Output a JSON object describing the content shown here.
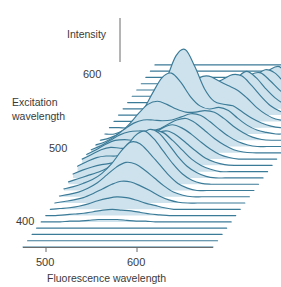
{
  "figure": {
    "type": "waterfall-3d-spectrum",
    "title": "",
    "axes": {
      "vertical": {
        "label": "Intensity",
        "name": "intensity-axis"
      },
      "depth": {
        "label_line1": "Excitation",
        "label_line2": "wavelength",
        "ticks": [
          "600",
          "500",
          "400"
        ],
        "units": "nm"
      },
      "horizontal": {
        "label": "Fluorescence wavelength",
        "ticks": [
          "500",
          "600"
        ],
        "units": "nm"
      }
    },
    "colors": {
      "trace_fill": "#cde2ec",
      "trace_stroke": "#3c7b98",
      "axis": "#6b6b6b",
      "text": "#3a3a3a",
      "background": "#ffffff"
    }
  },
  "chart_data": {
    "type": "line",
    "title": "",
    "subtitle": "",
    "xlabel": "Fluorescence wavelength",
    "ylabel": "Intensity",
    "zlabel": "Excitation wavelength",
    "xlim": [
      460,
      680
    ],
    "zlim": [
      380,
      620
    ],
    "xticks": [
      500,
      600
    ],
    "zticks": [
      400,
      500,
      600
    ],
    "grid": false,
    "legend": null,
    "n_traces": 30,
    "x": [
      0,
      0.05,
      0.1,
      0.15,
      0.2,
      0.25,
      0.3,
      0.35,
      0.4,
      0.45,
      0.5,
      0.55,
      0.6,
      0.65,
      0.7,
      0.75,
      0.8,
      0.85,
      0.9,
      0.95,
      1.0
    ],
    "series": [
      {
        "name": "ex_620",
        "z": 620,
        "values": [
          0,
          0,
          0,
          0,
          0,
          0,
          0,
          0,
          0,
          0,
          0,
          0,
          0,
          0,
          0,
          0,
          0,
          0,
          0,
          0,
          0
        ]
      },
      {
        "name": "ex_612",
        "z": 612,
        "values": [
          0,
          0,
          0,
          0,
          0,
          0,
          0,
          0,
          0,
          0,
          0,
          0,
          0,
          0,
          0,
          0,
          0,
          0,
          0,
          0,
          0
        ]
      },
      {
        "name": "ex_604",
        "z": 604,
        "values": [
          0,
          0,
          0,
          0,
          0,
          0,
          0,
          0,
          0,
          0,
          0,
          0,
          0,
          0,
          0.05,
          0.1,
          0.07,
          0.03,
          0.01,
          0,
          0
        ]
      },
      {
        "name": "ex_596",
        "z": 596,
        "values": [
          0,
          0,
          0,
          0,
          0,
          0,
          0,
          0,
          0,
          0,
          0,
          0,
          0.02,
          0.06,
          0.14,
          0.22,
          0.14,
          0.06,
          0.02,
          0,
          0
        ]
      },
      {
        "name": "ex_588",
        "z": 588,
        "values": [
          0,
          0,
          0,
          0,
          0,
          0,
          0,
          0,
          0,
          0,
          0,
          0.03,
          0.08,
          0.16,
          0.26,
          0.3,
          0.18,
          0.08,
          0.03,
          0,
          0
        ]
      },
      {
        "name": "ex_580",
        "z": 580,
        "values": [
          0,
          0,
          0,
          0,
          0,
          0,
          0,
          0,
          0,
          0.02,
          0.05,
          0.09,
          0.16,
          0.26,
          0.34,
          0.3,
          0.18,
          0.08,
          0.03,
          0,
          0
        ]
      },
      {
        "name": "ex_572",
        "z": 572,
        "values": [
          0,
          0,
          0,
          0,
          0,
          0,
          0,
          0,
          0.03,
          0.07,
          0.12,
          0.18,
          0.26,
          0.36,
          0.38,
          0.28,
          0.16,
          0.07,
          0.02,
          0,
          0
        ]
      },
      {
        "name": "ex_564",
        "z": 564,
        "values": [
          0,
          0,
          0,
          0,
          0,
          0,
          0.02,
          0.05,
          0.1,
          0.16,
          0.22,
          0.3,
          0.4,
          0.48,
          0.4,
          0.26,
          0.14,
          0.06,
          0.02,
          0,
          0
        ]
      },
      {
        "name": "ex_556",
        "z": 556,
        "values": [
          0,
          0,
          0,
          0,
          0,
          0.03,
          0.07,
          0.13,
          0.22,
          0.32,
          0.4,
          0.46,
          0.52,
          0.5,
          0.38,
          0.24,
          0.12,
          0.05,
          0.01,
          0,
          0
        ]
      },
      {
        "name": "ex_548",
        "z": 548,
        "values": [
          0,
          0,
          0,
          0,
          0.04,
          0.1,
          0.18,
          0.3,
          0.44,
          0.56,
          0.58,
          0.52,
          0.46,
          0.4,
          0.3,
          0.18,
          0.09,
          0.03,
          0.01,
          0,
          0
        ]
      },
      {
        "name": "ex_540",
        "z": 540,
        "values": [
          0,
          0,
          0,
          0.06,
          0.16,
          0.34,
          0.62,
          0.92,
          1.0,
          0.78,
          0.5,
          0.34,
          0.3,
          0.28,
          0.2,
          0.12,
          0.06,
          0.02,
          0,
          0,
          0
        ]
      },
      {
        "name": "ex_532",
        "z": 532,
        "values": [
          0,
          0,
          0.05,
          0.14,
          0.3,
          0.52,
          0.72,
          0.78,
          0.66,
          0.48,
          0.36,
          0.32,
          0.34,
          0.3,
          0.2,
          0.11,
          0.05,
          0.02,
          0,
          0,
          0
        ]
      },
      {
        "name": "ex_524",
        "z": 524,
        "values": [
          0,
          0.03,
          0.09,
          0.2,
          0.34,
          0.46,
          0.5,
          0.46,
          0.4,
          0.36,
          0.36,
          0.38,
          0.36,
          0.28,
          0.18,
          0.1,
          0.04,
          0.01,
          0,
          0,
          0
        ]
      },
      {
        "name": "ex_516",
        "z": 516,
        "values": [
          0.02,
          0.06,
          0.13,
          0.22,
          0.3,
          0.34,
          0.34,
          0.33,
          0.34,
          0.38,
          0.42,
          0.4,
          0.32,
          0.22,
          0.13,
          0.06,
          0.02,
          0,
          0,
          0,
          0
        ]
      },
      {
        "name": "ex_508",
        "z": 508,
        "values": [
          0.04,
          0.09,
          0.16,
          0.23,
          0.27,
          0.28,
          0.28,
          0.3,
          0.36,
          0.42,
          0.44,
          0.38,
          0.28,
          0.18,
          0.1,
          0.04,
          0.01,
          0,
          0,
          0,
          0
        ]
      },
      {
        "name": "ex_500",
        "z": 500,
        "values": [
          0.06,
          0.12,
          0.19,
          0.24,
          0.25,
          0.24,
          0.26,
          0.32,
          0.4,
          0.44,
          0.4,
          0.32,
          0.22,
          0.13,
          0.06,
          0.02,
          0,
          0,
          0,
          0,
          0
        ]
      },
      {
        "name": "ex_492",
        "z": 492,
        "values": [
          0.08,
          0.14,
          0.2,
          0.23,
          0.22,
          0.22,
          0.26,
          0.34,
          0.42,
          0.44,
          0.38,
          0.28,
          0.18,
          0.09,
          0.04,
          0.01,
          0,
          0,
          0,
          0,
          0
        ]
      },
      {
        "name": "ex_484",
        "z": 484,
        "values": [
          0.07,
          0.13,
          0.18,
          0.2,
          0.2,
          0.22,
          0.3,
          0.42,
          0.52,
          0.5,
          0.4,
          0.28,
          0.16,
          0.08,
          0.03,
          0,
          0,
          0,
          0,
          0,
          0
        ]
      },
      {
        "name": "ex_476",
        "z": 476,
        "values": [
          0.05,
          0.1,
          0.14,
          0.17,
          0.19,
          0.24,
          0.36,
          0.52,
          0.62,
          0.58,
          0.44,
          0.28,
          0.15,
          0.07,
          0.02,
          0,
          0,
          0,
          0,
          0,
          0
        ]
      },
      {
        "name": "ex_468",
        "z": 468,
        "values": [
          0.03,
          0.07,
          0.11,
          0.15,
          0.2,
          0.3,
          0.46,
          0.62,
          0.68,
          0.58,
          0.42,
          0.26,
          0.13,
          0.05,
          0.01,
          0,
          0,
          0,
          0,
          0,
          0
        ]
      },
      {
        "name": "ex_460",
        "z": 460,
        "values": [
          0.02,
          0.05,
          0.09,
          0.14,
          0.22,
          0.34,
          0.5,
          0.62,
          0.6,
          0.48,
          0.34,
          0.2,
          0.09,
          0.03,
          0,
          0,
          0,
          0,
          0,
          0,
          0
        ]
      },
      {
        "name": "ex_452",
        "z": 452,
        "values": [
          0.01,
          0.03,
          0.06,
          0.11,
          0.18,
          0.28,
          0.38,
          0.44,
          0.42,
          0.34,
          0.24,
          0.14,
          0.06,
          0.02,
          0,
          0,
          0,
          0,
          0,
          0,
          0
        ]
      },
      {
        "name": "ex_444",
        "z": 444,
        "values": [
          0,
          0.02,
          0.04,
          0.07,
          0.12,
          0.18,
          0.24,
          0.28,
          0.27,
          0.22,
          0.16,
          0.09,
          0.04,
          0.01,
          0,
          0,
          0,
          0,
          0,
          0,
          0
        ]
      },
      {
        "name": "ex_436",
        "z": 436,
        "values": [
          0,
          0.01,
          0.02,
          0.04,
          0.07,
          0.11,
          0.14,
          0.16,
          0.15,
          0.12,
          0.08,
          0.05,
          0.02,
          0,
          0,
          0,
          0,
          0,
          0,
          0,
          0
        ]
      },
      {
        "name": "ex_428",
        "z": 428,
        "values": [
          0,
          0,
          0.01,
          0.02,
          0.03,
          0.05,
          0.07,
          0.08,
          0.07,
          0.06,
          0.04,
          0.02,
          0.01,
          0,
          0,
          0,
          0,
          0,
          0,
          0,
          0
        ]
      },
      {
        "name": "ex_420",
        "z": 420,
        "values": [
          0,
          0,
          0,
          0.01,
          0.01,
          0.02,
          0.03,
          0.03,
          0.03,
          0.02,
          0.01,
          0.01,
          0,
          0,
          0,
          0,
          0,
          0,
          0,
          0,
          0
        ]
      },
      {
        "name": "ex_412",
        "z": 412,
        "values": [
          0,
          0,
          0,
          0,
          0,
          0,
          0,
          0,
          0,
          0,
          0,
          0,
          0,
          0,
          0,
          0,
          0,
          0,
          0,
          0,
          0
        ]
      },
      {
        "name": "ex_404",
        "z": 404,
        "values": [
          0,
          0,
          0,
          0,
          0,
          0,
          0,
          0,
          0,
          0,
          0,
          0,
          0,
          0,
          0,
          0,
          0,
          0,
          0,
          0,
          0
        ]
      },
      {
        "name": "ex_396",
        "z": 396,
        "values": [
          0,
          0,
          0,
          0,
          0,
          0,
          0,
          0,
          0,
          0,
          0,
          0,
          0,
          0,
          0,
          0,
          0,
          0,
          0,
          0,
          0
        ]
      },
      {
        "name": "ex_388",
        "z": 388,
        "values": [
          0,
          0,
          0,
          0,
          0,
          0,
          0,
          0,
          0,
          0,
          0,
          0,
          0,
          0,
          0,
          0,
          0,
          0,
          0,
          0,
          0
        ]
      }
    ]
  },
  "geometry": {
    "origin_x": 23,
    "origin_y": 247,
    "x_span": 190,
    "row_dx": 4.55,
    "row_dy": -6.28,
    "peak_scale": 78,
    "axis_top_y": 18,
    "axis_x": 120
  },
  "ticks": {
    "intensity_label": "Intensity",
    "excitation_600": "600",
    "excitation_500": "500",
    "excitation_400": "400",
    "fluorescence_500": "500",
    "fluorescence_600": "600"
  }
}
